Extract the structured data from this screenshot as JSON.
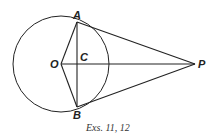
{
  "diagram": {
    "points": {
      "A": {
        "label": "A",
        "x": 77,
        "y": 22
      },
      "B": {
        "label": "B",
        "x": 77,
        "y": 107
      },
      "C": {
        "label": "C",
        "x": 77,
        "y": 64
      },
      "O": {
        "label": "O",
        "x": 61,
        "y": 64
      },
      "P": {
        "label": "P",
        "x": 195,
        "y": 64
      }
    },
    "circle": {
      "center": "O",
      "radius": 48
    },
    "segments": [
      [
        "O",
        "A"
      ],
      [
        "O",
        "B"
      ],
      [
        "A",
        "B"
      ],
      [
        "O",
        "P"
      ],
      [
        "A",
        "P"
      ],
      [
        "B",
        "P"
      ]
    ],
    "caption": "Exs. 11, 12",
    "stroke_color": "#222222"
  }
}
